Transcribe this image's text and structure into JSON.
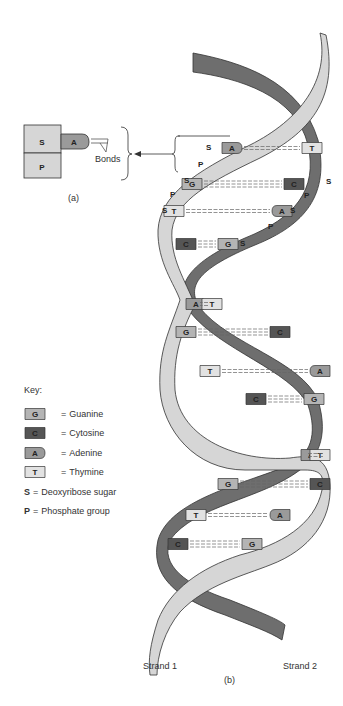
{
  "panel_a": {
    "sugar_label": "S",
    "phosphate_label": "P",
    "base_label": "A",
    "bonds_label": "Bonds",
    "caption": "(a)"
  },
  "panel_b": {
    "caption": "(b)",
    "strand1_label": "Strand 1",
    "strand2_label": "Strand 2",
    "backbone_labels": {
      "sugar": "S",
      "phosphate": "P"
    },
    "base_pairs": [
      {
        "left": "A",
        "right": "T"
      },
      {
        "left": "G",
        "right": "C"
      },
      {
        "left": "T",
        "right": "A"
      },
      {
        "left": "C",
        "right": "G"
      },
      {
        "left": "A",
        "right": "T"
      },
      {
        "left": "G",
        "right": "C"
      },
      {
        "left": "T",
        "right": "A"
      },
      {
        "left": "C",
        "right": "G"
      },
      {
        "left": "A",
        "right": "T"
      },
      {
        "left": "G",
        "right": "C"
      },
      {
        "left": "T",
        "right": "A"
      },
      {
        "left": "C",
        "right": "G"
      }
    ]
  },
  "key": {
    "title": "Key:",
    "items": [
      {
        "symbol": "G",
        "label": "Guanine"
      },
      {
        "symbol": "C",
        "label": "Cytosine"
      },
      {
        "symbol": "A",
        "label": "Adenine"
      },
      {
        "symbol": "T",
        "label": "Thymine"
      },
      {
        "symbol": "S",
        "label": "Deoxyribose sugar"
      },
      {
        "symbol": "P",
        "label": "Phosphate group"
      }
    ],
    "equals": "="
  },
  "colors": {
    "strand_light": "#d6d6d6",
    "strand_dark": "#6e6e6e",
    "guanine": "#b4b4b4",
    "cytosine": "#555555",
    "adenine": "#9a9a9a",
    "thymine": "#e2e2e2",
    "outline": "#333333"
  }
}
